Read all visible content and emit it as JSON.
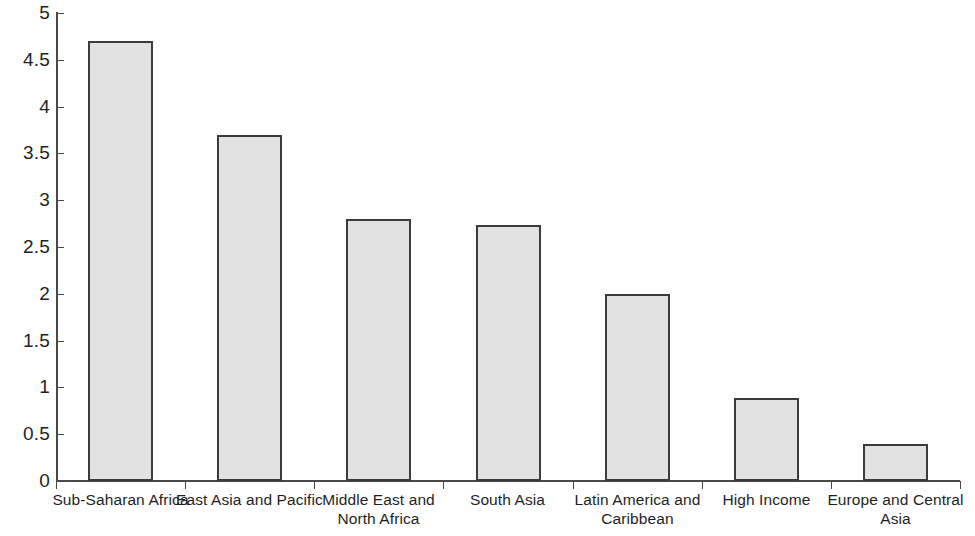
{
  "chart_data": {
    "type": "bar",
    "title": "",
    "subtitle": "",
    "xlabel": "",
    "ylabel": "",
    "ylim": [
      0,
      5
    ],
    "ytick_step": 0.5,
    "grid": false,
    "legend": false,
    "legend_position": "none",
    "categories": [
      "Sub-Saharan Africa",
      "East Asia and Pacific",
      "Middle East and\nNorth Africa",
      "South Asia",
      "Latin America and\nCaribbean",
      "High Income",
      "Europe and Central\nAsia"
    ],
    "values": [
      4.7,
      3.7,
      2.8,
      2.74,
      2.0,
      0.89,
      0.4
    ],
    "ytick_labels": [
      "0",
      "0.5",
      "1",
      "1.5",
      "2",
      "2.5",
      "3",
      "3.5",
      "4",
      "4.5",
      "5"
    ],
    "ytick_values": [
      0,
      0.5,
      1,
      1.5,
      2,
      2.5,
      3,
      3.5,
      4,
      4.5,
      5
    ],
    "bar_fill_color": "#e2e2e2",
    "bar_edge_color": "#3c3c3c",
    "axis_color": "#4a4a4a",
    "background_color": "#ffffff"
  }
}
